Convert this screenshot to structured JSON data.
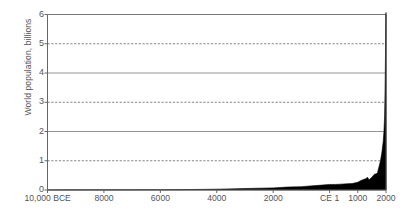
{
  "chart_data": {
    "type": "area",
    "title": "",
    "xlabel": "",
    "ylabel": "World population, billions",
    "xlim": [
      -10000,
      2000
    ],
    "ylim": [
      0,
      6
    ],
    "grid": true,
    "legend": null,
    "y_ticks": [
      0,
      1,
      2,
      3,
      4,
      5,
      6
    ],
    "y_tick_labels": [
      "0",
      "1",
      "2",
      "3",
      "4",
      "5",
      "6"
    ],
    "gridline_styles": {
      "0": "axis",
      "1": "dashed",
      "2": "solid",
      "3": "dashed",
      "4": "solid",
      "5": "dashed",
      "6": "border"
    },
    "x_ticks": [
      -10000,
      -8000,
      -6000,
      -4000,
      -2000,
      1,
      1000,
      2000
    ],
    "x_tick_labels": [
      "10,000 BCE",
      "8000",
      "6000",
      "4000",
      "2000",
      "CE 1",
      "1000",
      "2000"
    ],
    "series_name": "World population",
    "fill_color": "#000000",
    "x": [
      -10000,
      -9000,
      -8000,
      -7000,
      -6000,
      -5000,
      -4000,
      -3000,
      -2000,
      -1500,
      -1000,
      -500,
      1,
      200,
      400,
      600,
      800,
      1000,
      1100,
      1200,
      1300,
      1340,
      1400,
      1500,
      1600,
      1650,
      1700,
      1750,
      1800,
      1850,
      1900,
      1927,
      1950,
      1960,
      1974,
      1987,
      1999,
      2000
    ],
    "values": [
      0.004,
      0.005,
      0.005,
      0.007,
      0.01,
      0.015,
      0.028,
      0.05,
      0.072,
      0.1,
      0.115,
      0.15,
      0.19,
      0.19,
      0.2,
      0.21,
      0.22,
      0.265,
      0.32,
      0.36,
      0.39,
      0.44,
      0.35,
      0.44,
      0.55,
      0.55,
      0.6,
      0.79,
      0.98,
      1.26,
      1.65,
      2.0,
      2.52,
      3.02,
      4.0,
      5.0,
      6.0,
      6.07
    ]
  }
}
